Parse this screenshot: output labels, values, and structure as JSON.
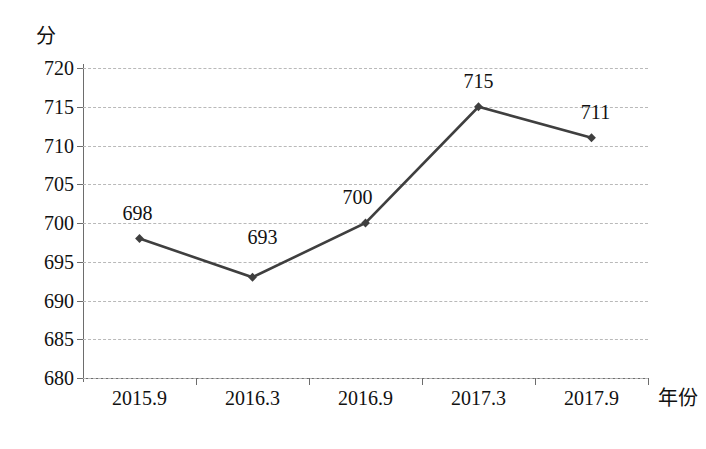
{
  "chart_data": {
    "type": "line",
    "title": "",
    "subtitle": "",
    "xlabel": "年份",
    "ylabel": "分",
    "categories": [
      "2015.9",
      "2016.3",
      "2016.9",
      "2017.3",
      "2017.9"
    ],
    "values": [
      698,
      693,
      700,
      715,
      711
    ],
    "point_labels": [
      "698",
      "693",
      "700",
      "715",
      "711"
    ],
    "ylim": [
      680,
      720
    ],
    "yticks": [
      680,
      685,
      690,
      695,
      700,
      705,
      710,
      715,
      720
    ],
    "ytick_labels": [
      "680",
      "685",
      "690",
      "695",
      "700",
      "705",
      "710",
      "715",
      "720"
    ],
    "grid": true,
    "legend": "none",
    "series": [
      {
        "name": "分",
        "values": [
          698,
          693,
          700,
          715,
          711
        ],
        "color": "#3f3f3f",
        "marker": "diamond"
      }
    ],
    "colors": {
      "line": "#3f3f3f",
      "marker": "#3f3f3f",
      "grid": "#b9b9b9",
      "axis": "#6d6d6d",
      "text": "#111111",
      "background": "#ffffff"
    }
  }
}
